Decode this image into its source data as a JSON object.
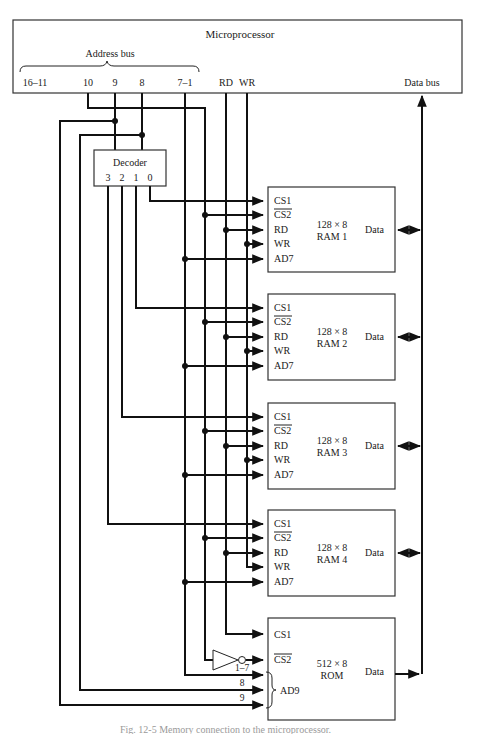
{
  "microprocessor": {
    "title": "Microprocessor",
    "address_bus_label": "Address bus",
    "address_lines": [
      "16–11",
      "10",
      "9",
      "8",
      "7–1"
    ],
    "control_lines": [
      "RD",
      "WR"
    ],
    "data_bus_label": "Data bus"
  },
  "decoder": {
    "title": "Decoder",
    "outputs": [
      "3",
      "2",
      "1",
      "0"
    ]
  },
  "rams": [
    {
      "size": "128 × 8",
      "name": "RAM 1",
      "pins": [
        "CS1",
        "CS2",
        "RD",
        "WR",
        "AD7"
      ],
      "data": "Data"
    },
    {
      "size": "128 × 8",
      "name": "RAM 2",
      "pins": [
        "CS1",
        "CS2",
        "RD",
        "WR",
        "AD7"
      ],
      "data": "Data"
    },
    {
      "size": "128 × 8",
      "name": "RAM 3",
      "pins": [
        "CS1",
        "CS2",
        "RD",
        "WR",
        "AD7"
      ],
      "data": "Data"
    },
    {
      "size": "128 × 8",
      "name": "RAM 4",
      "pins": [
        "CS1",
        "CS2",
        "RD",
        "WR",
        "AD7"
      ],
      "data": "Data"
    }
  ],
  "rom": {
    "size": "512 × 8",
    "name": "ROM",
    "pins": [
      "CS1",
      "CS2"
    ],
    "address_label": "AD9",
    "address_inputs": [
      "1–7",
      "8",
      "9"
    ],
    "data": "Data"
  },
  "caption": "Fig. 12-5  Memory connection to the microprocessor."
}
